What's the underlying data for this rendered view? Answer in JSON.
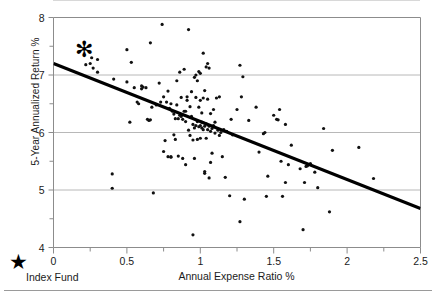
{
  "chart_data": {
    "type": "scatter",
    "title": "",
    "xlabel": "Annual Expense Ratio %",
    "ylabel": "5-Year Annualized Return %",
    "xlim": [
      0,
      2.5
    ],
    "ylim": [
      4,
      8
    ],
    "xticks": [
      "0",
      "0.5",
      "1",
      "1.5",
      "2",
      "2.5"
    ],
    "xtick_values": [
      0,
      0.5,
      1,
      1.5,
      2,
      2.5
    ],
    "yticks": [
      "4",
      "5",
      "6",
      "7",
      "8"
    ],
    "ytick_values": [
      4,
      5,
      6,
      7,
      8
    ],
    "minor_xticks": [
      0.25,
      0.75,
      1.25,
      1.75,
      2.25
    ],
    "minor_yticks": [
      4.5,
      5.5,
      6.5,
      7.5
    ],
    "grid": "horizontal-major",
    "grid_color": "#b8b8b8",
    "axis_color": "#8c8c8c",
    "point_color": "#111111",
    "point_size": 3.2,
    "trendline": {
      "type": "linear",
      "x0": 0,
      "y0": 7.2,
      "x1": 2.5,
      "y1": 4.68,
      "color": "#000000",
      "width": 3.2
    },
    "highlight_marker": {
      "label": "Index Fund",
      "symbol": "star",
      "x": 0.21,
      "y": 7.45,
      "color": "#000000",
      "size": 22
    },
    "points": [
      [
        0.22,
        7.18
      ],
      [
        0.25,
        7.2
      ],
      [
        0.27,
        7.12
      ],
      [
        0.3,
        7.05
      ],
      [
        0.26,
        7.3
      ],
      [
        0.3,
        7.27
      ],
      [
        0.4,
        5.28
      ],
      [
        0.4,
        5.03
      ],
      [
        0.41,
        6.93
      ],
      [
        0.5,
        7.44
      ],
      [
        0.5,
        6.88
      ],
      [
        0.52,
        6.18
      ],
      [
        0.53,
        7.22
      ],
      [
        0.55,
        6.78
      ],
      [
        0.57,
        6.53
      ],
      [
        0.58,
        6.5
      ],
      [
        0.6,
        6.81
      ],
      [
        0.6,
        6.76
      ],
      [
        0.61,
        6.79
      ],
      [
        0.63,
        6.78
      ],
      [
        0.64,
        6.23
      ],
      [
        0.65,
        6.21
      ],
      [
        0.66,
        6.22
      ],
      [
        0.66,
        7.56
      ],
      [
        0.67,
        6.44
      ],
      [
        0.68,
        4.95
      ],
      [
        0.7,
        6.48
      ],
      [
        0.72,
        6.86
      ],
      [
        0.73,
        6.53
      ],
      [
        0.74,
        7.88
      ],
      [
        0.75,
        6.62
      ],
      [
        0.75,
        5.67
      ],
      [
        0.76,
        5.86
      ],
      [
        0.77,
        6.53
      ],
      [
        0.78,
        6.72
      ],
      [
        0.78,
        5.58
      ],
      [
        0.79,
        6.42
      ],
      [
        0.8,
        5.57
      ],
      [
        0.8,
        5.58
      ],
      [
        0.8,
        6.5
      ],
      [
        0.81,
        6.37
      ],
      [
        0.82,
        6.32
      ],
      [
        0.82,
        5.96
      ],
      [
        0.83,
        6.24
      ],
      [
        0.83,
        5.88
      ],
      [
        0.84,
        6.48
      ],
      [
        0.84,
        6.9
      ],
      [
        0.85,
        5.59
      ],
      [
        0.85,
        6.24
      ],
      [
        0.86,
        6.3
      ],
      [
        0.86,
        7.05
      ],
      [
        0.87,
        6.28
      ],
      [
        0.87,
        6.61
      ],
      [
        0.88,
        6.23
      ],
      [
        0.88,
        5.55
      ],
      [
        0.89,
        6.37
      ],
      [
        0.89,
        7.1
      ],
      [
        0.9,
        6.19
      ],
      [
        0.9,
        6.37
      ],
      [
        0.9,
        5.44
      ],
      [
        0.91,
        6.56
      ],
      [
        0.91,
        6.62
      ],
      [
        0.92,
        7.79
      ],
      [
        0.92,
        6.04
      ],
      [
        0.93,
        5.95
      ],
      [
        0.93,
        6.45
      ],
      [
        0.94,
        6.28
      ],
      [
        0.94,
        6.71
      ],
      [
        0.95,
        6.14
      ],
      [
        0.95,
        5.87
      ],
      [
        0.95,
        4.22
      ],
      [
        0.96,
        6.08
      ],
      [
        0.96,
        6.96
      ],
      [
        0.96,
        5.55
      ],
      [
        0.97,
        6.12
      ],
      [
        0.97,
        6.61
      ],
      [
        0.97,
        7.0
      ],
      [
        0.98,
        5.88
      ],
      [
        0.98,
        6.19
      ],
      [
        0.98,
        6.9
      ],
      [
        0.99,
        6.1
      ],
      [
        0.99,
        6.44
      ],
      [
        0.99,
        7.06
      ],
      [
        1.0,
        6.12
      ],
      [
        1.0,
        5.9
      ],
      [
        1.0,
        6.56
      ],
      [
        1.0,
        7.03
      ],
      [
        1.01,
        6.08
      ],
      [
        1.01,
        6.18
      ],
      [
        1.01,
        6.34
      ],
      [
        1.02,
        6.05
      ],
      [
        1.02,
        6.17
      ],
      [
        1.02,
        6.6
      ],
      [
        1.02,
        7.38
      ],
      [
        1.03,
        6.11
      ],
      [
        1.03,
        5.32
      ],
      [
        1.03,
        5.29
      ],
      [
        1.03,
        6.73
      ],
      [
        1.04,
        6.15
      ],
      [
        1.04,
        5.9
      ],
      [
        1.04,
        7.14
      ],
      [
        1.05,
        6.05
      ],
      [
        1.05,
        6.58
      ],
      [
        1.05,
        7.2
      ],
      [
        1.06,
        6.11
      ],
      [
        1.06,
        5.21
      ],
      [
        1.06,
        7.12
      ],
      [
        1.07,
        6.02
      ],
      [
        1.07,
        6.33
      ],
      [
        1.07,
        5.48
      ],
      [
        1.08,
        6.07
      ],
      [
        1.08,
        5.64
      ],
      [
        1.09,
        6.12
      ],
      [
        1.09,
        6.4
      ],
      [
        1.1,
        5.99
      ],
      [
        1.1,
        6.18
      ],
      [
        1.11,
        6.6
      ],
      [
        1.12,
        6.04
      ],
      [
        1.13,
        5.95
      ],
      [
        1.13,
        6.62
      ],
      [
        1.14,
        6.0
      ],
      [
        1.15,
        5.58
      ],
      [
        1.16,
        6.05
      ],
      [
        1.17,
        5.22
      ],
      [
        1.18,
        6.02
      ],
      [
        1.2,
        4.9
      ],
      [
        1.21,
        6.23
      ],
      [
        1.22,
        5.96
      ],
      [
        1.25,
        6.4
      ],
      [
        1.27,
        7.17
      ],
      [
        1.27,
        4.45
      ],
      [
        1.28,
        6.62
      ],
      [
        1.29,
        6.97
      ],
      [
        1.3,
        4.84
      ],
      [
        1.33,
        6.21
      ],
      [
        1.38,
        6.44
      ],
      [
        1.4,
        5.66
      ],
      [
        1.43,
        5.98
      ],
      [
        1.44,
        6.0
      ],
      [
        1.45,
        4.89
      ],
      [
        1.46,
        5.24
      ],
      [
        1.5,
        6.3
      ],
      [
        1.52,
        6.23
      ],
      [
        1.53,
        6.22
      ],
      [
        1.54,
        6.4
      ],
      [
        1.55,
        5.5
      ],
      [
        1.56,
        4.89
      ],
      [
        1.58,
        5.13
      ],
      [
        1.58,
        6.14
      ],
      [
        1.6,
        5.44
      ],
      [
        1.62,
        5.78
      ],
      [
        1.68,
        5.37
      ],
      [
        1.7,
        4.31
      ],
      [
        1.71,
        5.13
      ],
      [
        1.72,
        5.41
      ],
      [
        1.73,
        5.42
      ],
      [
        1.75,
        5.46
      ],
      [
        1.78,
        5.31
      ],
      [
        1.8,
        5.04
      ],
      [
        1.84,
        6.07
      ],
      [
        1.88,
        4.62
      ],
      [
        1.9,
        5.69
      ],
      [
        2.08,
        5.74
      ],
      [
        2.18,
        5.2
      ]
    ]
  },
  "legend": {
    "symbol": "★",
    "label": "Index Fund"
  },
  "axes": {
    "x_title": "Annual Expense Ratio %",
    "y_title": "5-Year Annualized Return %"
  }
}
